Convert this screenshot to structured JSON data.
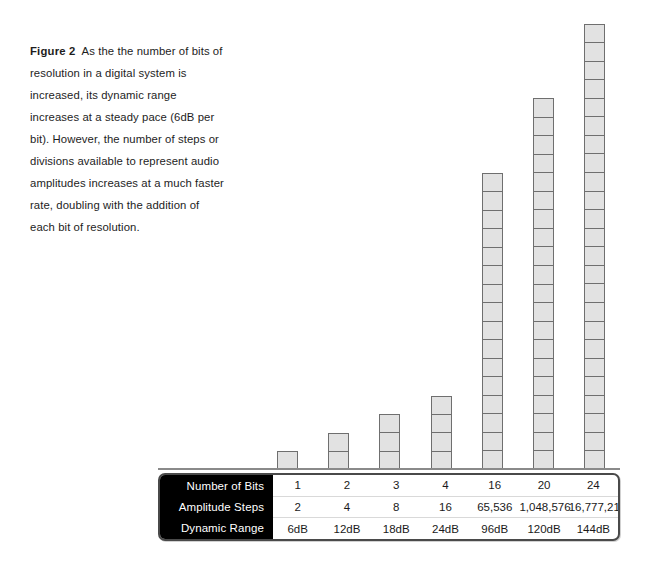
{
  "caption": {
    "label": "Figure 2",
    "text": "As the the number of bits of resolution in a digital system is increased, its dynamic range increases at a steady pace (6dB per bit). However, the number of steps or divisions available to represent audio amplitudes increases at a much faster rate, doubling with the addition of each bit of resolution."
  },
  "colors": {
    "bar_fill": "#e2e2e2",
    "bar_stroke": "#6f6f6f",
    "rowhead_bg": "#000000",
    "rowhead_text": "#ffffff",
    "table_border": "#4a4a4a"
  },
  "chart_data": {
    "type": "bar",
    "title": "",
    "xlabel": "Number of Bits",
    "ylabel": "Amplitude Steps (segments shown = number of bits)",
    "categories": [
      "1",
      "2",
      "3",
      "4",
      "16",
      "20",
      "24"
    ],
    "values": [
      1,
      2,
      3,
      4,
      16,
      20,
      24
    ],
    "series": [
      {
        "name": "Number of Bits",
        "values": [
          1,
          2,
          3,
          4,
          16,
          20,
          24
        ]
      },
      {
        "name": "Amplitude Steps",
        "values": [
          2,
          4,
          8,
          16,
          65536,
          1048576,
          16777216
        ]
      },
      {
        "name": "Dynamic Range",
        "values": [
          6,
          12,
          18,
          24,
          96,
          120,
          144
        ]
      }
    ],
    "ylim": [
      0,
      24
    ],
    "grid": false,
    "legend": "none",
    "note": "Each bar is drawn as a stack of equal-height segments; segment count equals the number of bits."
  },
  "table": {
    "rows": [
      {
        "header": "Number of Bits",
        "cells": [
          "1",
          "2",
          "3",
          "4",
          "16",
          "20",
          "24"
        ]
      },
      {
        "header": "Amplitude Steps",
        "cells": [
          "2",
          "4",
          "8",
          "16",
          "65,536",
          "1,048,576",
          "16,777,216"
        ]
      },
      {
        "header": "Dynamic Range",
        "cells": [
          "6dB",
          "12dB",
          "18dB",
          "24dB",
          "96dB",
          "120dB",
          "144dB"
        ]
      }
    ]
  }
}
